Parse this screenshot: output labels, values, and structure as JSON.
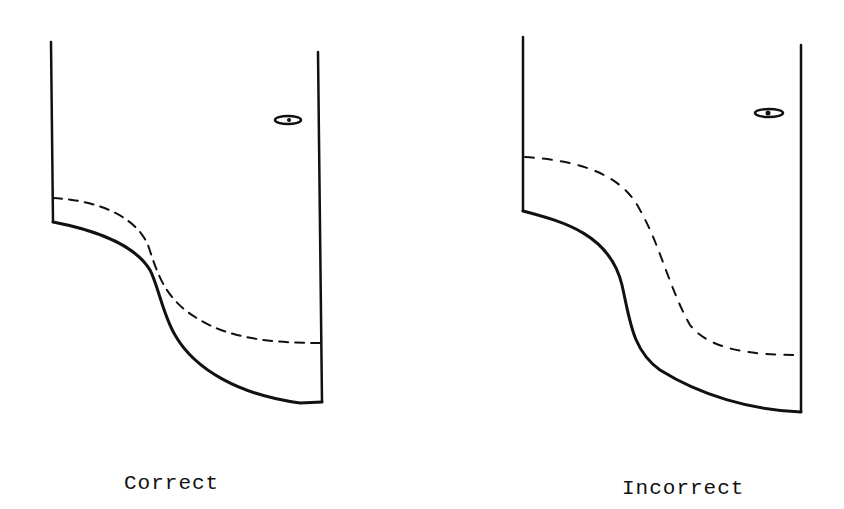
{
  "figure": {
    "panels": [
      {
        "id": "correct",
        "caption": "Correct",
        "description": "Dashed line closely follows the solid curved profile"
      },
      {
        "id": "incorrect",
        "caption": "Incorrect",
        "description": "Dashed line deviates far from the solid curved profile"
      }
    ],
    "colors": {
      "ink": "#111111",
      "background": "#ffffff"
    }
  }
}
